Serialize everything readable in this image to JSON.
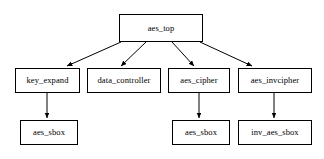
{
  "diagram": {
    "type": "hierarchy-block-diagram",
    "canvas": {
      "width": 324,
      "height": 159
    },
    "style": {
      "background": "#ffffff",
      "box_fill": "#ffffff",
      "box_stroke": "#000000",
      "edge_stroke": "#000000",
      "text_color": "#000000"
    },
    "nodes": [
      {
        "id": "aes_top",
        "label": "aes_top",
        "x": 119,
        "y": 14,
        "w": 84,
        "h": 28,
        "level": 0
      },
      {
        "id": "key_expand",
        "label": "key_expand",
        "x": 15,
        "y": 68,
        "w": 65,
        "h": 25,
        "level": 1
      },
      {
        "id": "data_controller",
        "label": "data_controller",
        "x": 87,
        "y": 68,
        "w": 74,
        "h": 25,
        "level": 1
      },
      {
        "id": "aes_cipher",
        "label": "aes_cipher",
        "x": 168,
        "y": 68,
        "w": 62,
        "h": 25,
        "level": 1
      },
      {
        "id": "aes_invcipher",
        "label": "aes_invcipher",
        "x": 238,
        "y": 68,
        "w": 74,
        "h": 25,
        "level": 1
      },
      {
        "id": "aes_sbox_key",
        "label": "aes_sbox",
        "x": 20,
        "y": 120,
        "w": 58,
        "h": 25,
        "level": 2
      },
      {
        "id": "aes_sbox_cip",
        "label": "aes_sbox",
        "x": 172,
        "y": 120,
        "w": 58,
        "h": 25,
        "level": 2
      },
      {
        "id": "inv_aes_sbox",
        "label": "inv_aes_sbox",
        "x": 238,
        "y": 120,
        "w": 74,
        "h": 25,
        "level": 2
      }
    ],
    "edges": [
      {
        "from": "aes_top",
        "to": "key_expand",
        "x1": 121,
        "y1": 42,
        "x2": 67,
        "y2": 66,
        "arrow": true
      },
      {
        "from": "aes_top",
        "to": "data_controller",
        "x1": 146,
        "y1": 42,
        "x2": 121,
        "y2": 66,
        "arrow": true
      },
      {
        "from": "aes_top",
        "to": "aes_cipher",
        "x1": 172,
        "y1": 42,
        "x2": 194,
        "y2": 66,
        "arrow": true
      },
      {
        "from": "aes_top",
        "to": "aes_invcipher",
        "x1": 200,
        "y1": 42,
        "x2": 252,
        "y2": 66,
        "arrow": true
      },
      {
        "from": "key_expand",
        "to": "aes_sbox_key",
        "x1": 47,
        "y1": 93,
        "x2": 47,
        "y2": 118,
        "arrow": true
      },
      {
        "from": "aes_cipher",
        "to": "aes_sbox_cip",
        "x1": 199,
        "y1": 93,
        "x2": 199,
        "y2": 118,
        "arrow": true
      },
      {
        "from": "aes_invcipher",
        "to": "inv_aes_sbox",
        "x1": 274,
        "y1": 93,
        "x2": 274,
        "y2": 118,
        "arrow": true
      }
    ]
  }
}
